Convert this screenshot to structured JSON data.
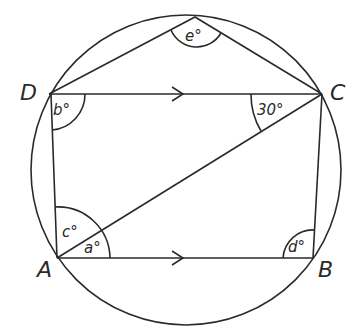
{
  "diagram": {
    "vertices": {
      "A": {
        "label": "A",
        "x": 57,
        "y": 258
      },
      "B": {
        "label": "B",
        "x": 313,
        "y": 258
      },
      "C": {
        "label": "C",
        "x": 322,
        "y": 94
      },
      "D": {
        "label": "D",
        "x": 49,
        "y": 94
      },
      "E": {
        "label": "",
        "x": 195,
        "y": 17
      }
    },
    "circle": {
      "cx": 186,
      "cy": 170,
      "r": 155
    },
    "angles": {
      "e": "e°",
      "b": "b°",
      "thirty": "30°",
      "c": "c°",
      "a": "a°",
      "d": "d°"
    },
    "notes": {
      "parallel": "DC is parallel to AB (arrow marks)"
    }
  }
}
